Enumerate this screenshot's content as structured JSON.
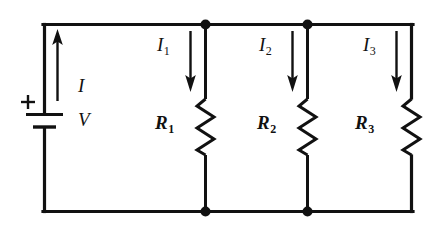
{
  "figure": {
    "kind": "circuit-diagram",
    "background_color": "#ffffff",
    "line_color": "#111111",
    "width": 445,
    "height": 232
  },
  "source": {
    "name": "battery",
    "voltage_label": "V",
    "polarity_label": "+",
    "current_label": "I",
    "current_direction": "up"
  },
  "branches": [
    {
      "resistor_label": "R",
      "resistor_subscript": "1",
      "current_label": "I",
      "current_subscript": "1",
      "current_direction": "down"
    },
    {
      "resistor_label": "R",
      "resistor_subscript": "2",
      "current_label": "I",
      "current_subscript": "2",
      "current_direction": "down"
    },
    {
      "resistor_label": "R",
      "resistor_subscript": "3",
      "current_label": "I",
      "current_subscript": "3",
      "current_direction": "down"
    }
  ],
  "nodes": {
    "count": 4,
    "positions": "top and bottom junctions between branch 1/2 and branch 2/3"
  }
}
